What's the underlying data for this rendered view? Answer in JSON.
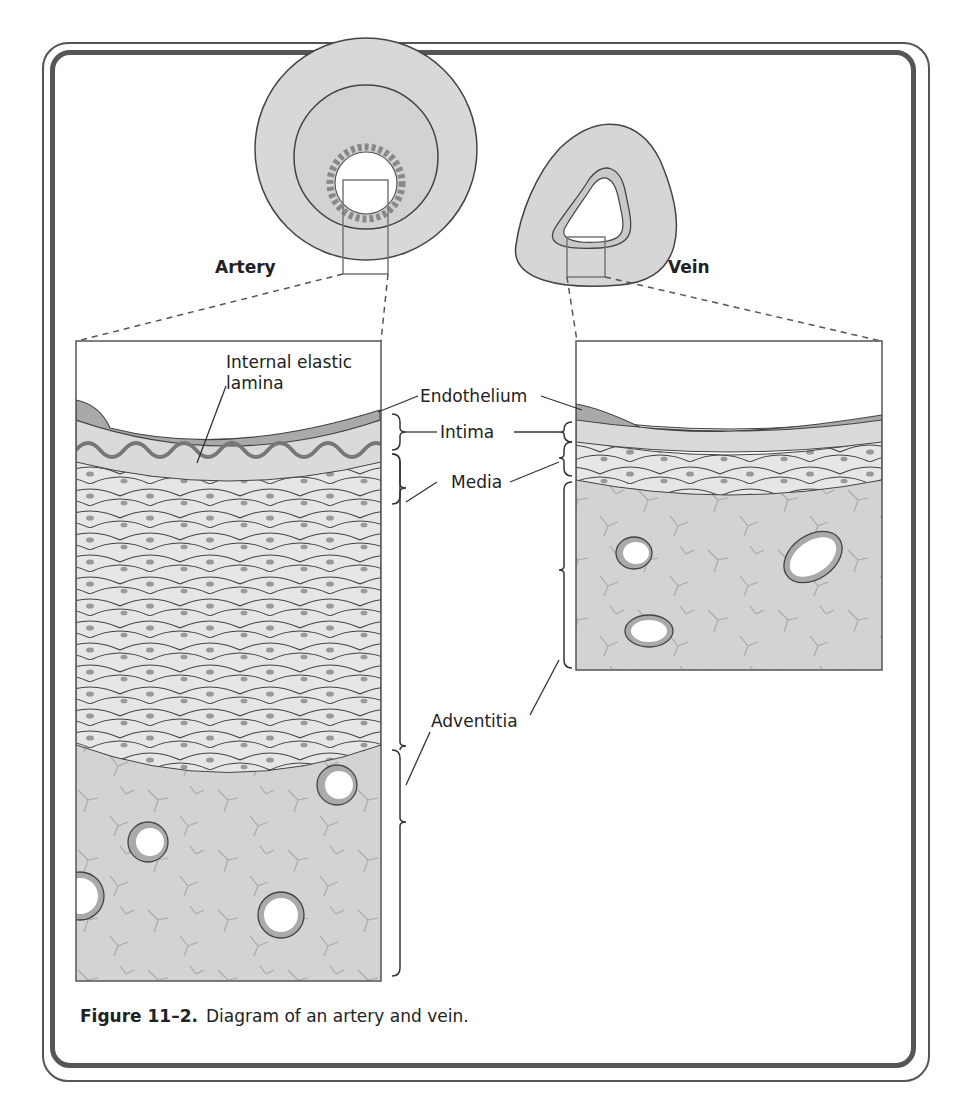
{
  "figure": {
    "number_label": "Figure 11–2.",
    "caption": "Diagram of an artery and vein."
  },
  "vessels": {
    "artery": {
      "title": "Artery"
    },
    "vein": {
      "title": "Vein"
    }
  },
  "labels": {
    "internal_elastic_lamina_line1": "Internal elastic",
    "internal_elastic_lamina_line2": "lamina",
    "endothelium": "Endothelium",
    "intima": "Intima",
    "media": "Media",
    "adventitia": "Adventitia"
  },
  "colors": {
    "frame": "#555555",
    "tissue_light": "#e4e4e4",
    "tissue_mid": "#cfcfcf",
    "endothelium": "#a8a8a8",
    "adventitia": "#d2d2d2",
    "nucleus": "#9a9a9a",
    "line": "#444444"
  }
}
